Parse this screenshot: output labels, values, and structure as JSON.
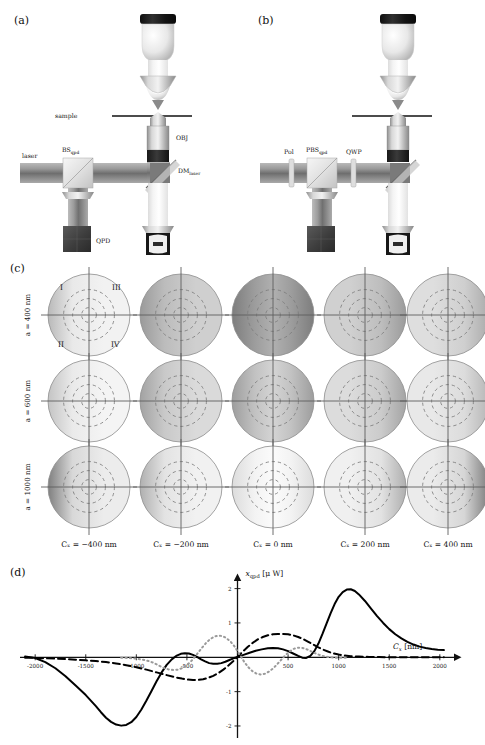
{
  "figure": {
    "panels": [
      {
        "tag": "(a)",
        "x": 14,
        "y": 14
      },
      {
        "tag": "(b)",
        "x": 258,
        "y": 14
      },
      {
        "tag": "(c)",
        "x": 10,
        "y": 262
      },
      {
        "tag": "(d)",
        "x": 10,
        "y": 566
      }
    ]
  },
  "panel_a": {
    "tag": "(a)",
    "labels": {
      "laser": "laser",
      "bs_main": "BS",
      "bs_sub": "qpd",
      "sample": "sample",
      "obj": "OBJ",
      "dm_main": "DM",
      "dm_sub": "laser",
      "qpd": "QPD"
    }
  },
  "panel_b": {
    "tag": "(b)",
    "labels": {
      "pol": "Pol",
      "pbs_main": "PBS",
      "pbs_sub": "qpd",
      "qwp": "QWP"
    }
  },
  "panel_c": {
    "tag": "(c)",
    "row_labels": [
      "a = 400 nm",
      "a = 600 nm",
      "a = 1000 nm"
    ],
    "col_labels": [
      "Cₓ = −400 nm",
      "Cₓ = −200 nm",
      "Cₓ = 0 nm",
      "Cₓ = 200 nm",
      "Cₓ = 400 nm"
    ],
    "quadrant_labels": [
      "I",
      "III",
      "II",
      "IV"
    ],
    "cx_values": [
      -400,
      -200,
      0,
      200,
      400
    ],
    "a_values": [
      400,
      600,
      1000
    ],
    "disk_shading": [
      [
        {
          "base": "#e9e9e9",
          "edge_dark": "#b9b9b9",
          "dir": 0.15,
          "center": "#f2f2f2"
        },
        {
          "base": "#bcbcbc",
          "edge_dark": "#9a9a9a",
          "dir": 0.45,
          "center": "#cfcfcf"
        },
        {
          "base": "#9d9d9d",
          "edge_dark": "#7d7d7d",
          "dir": 0.85,
          "center": "#b0b0b0"
        },
        {
          "base": "#bdbdbd",
          "edge_dark": "#9b9b9b",
          "dir": 0.45,
          "center": "#d0d0d0"
        },
        {
          "base": "#cfcfcf",
          "edge_dark": "#ababab",
          "dir": 0.3,
          "center": "#dedede"
        }
      ],
      [
        {
          "base": "#eaeaea",
          "edge_dark": "#c4c4c4",
          "dir": 0.2,
          "center": "#f4f4f4"
        },
        {
          "base": "#c9c9c9",
          "edge_dark": "#a2a2a2",
          "dir": 0.4,
          "center": "#dadada"
        },
        {
          "base": "#c2c2c2",
          "edge_dark": "#9d9d9d",
          "dir": 0.55,
          "center": "#d4d4d4"
        },
        {
          "base": "#cbcbcb",
          "edge_dark": "#a4a4a4",
          "dir": 0.4,
          "center": "#dcdcdc"
        },
        {
          "base": "#dcdcdc",
          "edge_dark": "#b6b6b6",
          "dir": 0.25,
          "center": "#e8e8e8"
        }
      ],
      [
        {
          "base": "#d8d8d8",
          "edge_dark": "#7f7f7f",
          "dir": 0.95,
          "center": "#ececec"
        },
        {
          "base": "#e3e3e3",
          "edge_dark": "#b0b0b0",
          "dir": 0.5,
          "center": "#f1f1f1"
        },
        {
          "base": "#f3f3f3",
          "edge_dark": "#dcdcdc",
          "dir": 0.1,
          "center": "#fbfbfb"
        },
        {
          "base": "#e2e2e2",
          "edge_dark": "#afafaf",
          "dir": 0.5,
          "center": "#f0f0f0"
        },
        {
          "base": "#d6d6d6",
          "edge_dark": "#7c7c7c",
          "dir": 0.95,
          "center": "#ebebeb"
        }
      ]
    ]
  },
  "panel_d": {
    "tag": "(d)"
  },
  "chart_data": {
    "type": "line",
    "title": "",
    "xlabel": "Cₓ [nm]",
    "ylabel": "x_qpd [μW]",
    "ylabel_main": "x",
    "ylabel_sub": "qpd",
    "ylabel_unit": "[μ W]",
    "xlabel_main": "C",
    "xlabel_sub": "x",
    "xlabel_unit": "[nm]",
    "xlim": [
      -2150,
      2150
    ],
    "ylim": [
      -2.35,
      2.25
    ],
    "xticks": [
      -2000,
      -1500,
      -1000,
      -500,
      500,
      1000,
      1500,
      2000
    ],
    "xticklabels": [
      "-2000",
      "-1500",
      "-1000",
      "-500",
      "500",
      "1000",
      "1500",
      "2000"
    ],
    "yticks": [
      2,
      1,
      -1,
      -2
    ],
    "yticklabels": [
      "2",
      "1",
      "-1",
      "-2"
    ],
    "grid": false,
    "legend": "none",
    "series": [
      {
        "name": "solid",
        "style": "solid",
        "color": "#000000",
        "width": 2.0,
        "points": [
          [
            -2100,
            0.02
          ],
          [
            -2000,
            -0.02
          ],
          [
            -1900,
            -0.14
          ],
          [
            -1800,
            -0.32
          ],
          [
            -1700,
            -0.55
          ],
          [
            -1600,
            -0.82
          ],
          [
            -1500,
            -1.1
          ],
          [
            -1400,
            -1.42
          ],
          [
            -1350,
            -1.6
          ],
          [
            -1300,
            -1.76
          ],
          [
            -1250,
            -1.88
          ],
          [
            -1200,
            -1.96
          ],
          [
            -1150,
            -1.99
          ],
          [
            -1100,
            -1.97
          ],
          [
            -1050,
            -1.89
          ],
          [
            -1000,
            -1.74
          ],
          [
            -950,
            -1.52
          ],
          [
            -900,
            -1.26
          ],
          [
            -850,
            -0.98
          ],
          [
            -800,
            -0.7
          ],
          [
            -750,
            -0.44
          ],
          [
            -700,
            -0.22
          ],
          [
            -650,
            -0.06
          ],
          [
            -600,
            0.05
          ],
          [
            -560,
            0.1
          ],
          [
            -520,
            0.12
          ],
          [
            -480,
            0.11
          ],
          [
            -440,
            0.07
          ],
          [
            -400,
            0.01
          ],
          [
            -360,
            -0.06
          ],
          [
            -320,
            -0.12
          ],
          [
            -280,
            -0.17
          ],
          [
            -240,
            -0.19
          ],
          [
            -200,
            -0.19
          ],
          [
            -160,
            -0.17
          ],
          [
            -120,
            -0.13
          ],
          [
            -80,
            -0.08
          ],
          [
            -40,
            -0.03
          ],
          [
            0,
            0.01
          ],
          [
            60,
            0.07
          ],
          [
            120,
            0.13
          ],
          [
            180,
            0.19
          ],
          [
            240,
            0.23
          ],
          [
            300,
            0.26
          ],
          [
            350,
            0.27
          ],
          [
            400,
            0.26
          ],
          [
            450,
            0.23
          ],
          [
            500,
            0.18
          ],
          [
            550,
            0.11
          ],
          [
            600,
            0.04
          ],
          [
            640,
            -0.01
          ],
          [
            680,
            -0.02
          ],
          [
            720,
            0.04
          ],
          [
            760,
            0.18
          ],
          [
            800,
            0.4
          ],
          [
            840,
            0.68
          ],
          [
            880,
            0.98
          ],
          [
            920,
            1.28
          ],
          [
            960,
            1.55
          ],
          [
            1000,
            1.76
          ],
          [
            1040,
            1.9
          ],
          [
            1080,
            1.97
          ],
          [
            1120,
            1.98
          ],
          [
            1160,
            1.93
          ],
          [
            1200,
            1.83
          ],
          [
            1260,
            1.64
          ],
          [
            1320,
            1.42
          ],
          [
            1380,
            1.2
          ],
          [
            1440,
            1.0
          ],
          [
            1500,
            0.82
          ],
          [
            1560,
            0.67
          ],
          [
            1620,
            0.55
          ],
          [
            1680,
            0.45
          ],
          [
            1740,
            0.37
          ],
          [
            1800,
            0.31
          ],
          [
            1860,
            0.27
          ],
          [
            1920,
            0.24
          ],
          [
            1980,
            0.22
          ],
          [
            2040,
            0.21
          ]
        ]
      },
      {
        "name": "dashed",
        "style": "dashed",
        "color": "#000000",
        "width": 2.0,
        "points": [
          [
            -2100,
            -0.01
          ],
          [
            -2000,
            -0.02
          ],
          [
            -1900,
            -0.03
          ],
          [
            -1800,
            -0.04
          ],
          [
            -1700,
            -0.05
          ],
          [
            -1600,
            -0.07
          ],
          [
            -1500,
            -0.09
          ],
          [
            -1400,
            -0.11
          ],
          [
            -1300,
            -0.14
          ],
          [
            -1200,
            -0.18
          ],
          [
            -1100,
            -0.23
          ],
          [
            -1000,
            -0.29
          ],
          [
            -900,
            -0.36
          ],
          [
            -800,
            -0.44
          ],
          [
            -700,
            -0.52
          ],
          [
            -620,
            -0.58
          ],
          [
            -550,
            -0.62
          ],
          [
            -490,
            -0.65
          ],
          [
            -440,
            -0.66
          ],
          [
            -390,
            -0.66
          ],
          [
            -340,
            -0.64
          ],
          [
            -290,
            -0.6
          ],
          [
            -240,
            -0.54
          ],
          [
            -190,
            -0.46
          ],
          [
            -140,
            -0.36
          ],
          [
            -90,
            -0.24
          ],
          [
            -40,
            -0.11
          ],
          [
            0,
            0.01
          ],
          [
            50,
            0.16
          ],
          [
            100,
            0.3
          ],
          [
            150,
            0.42
          ],
          [
            200,
            0.52
          ],
          [
            250,
            0.59
          ],
          [
            300,
            0.64
          ],
          [
            350,
            0.67
          ],
          [
            400,
            0.68
          ],
          [
            450,
            0.68
          ],
          [
            500,
            0.67
          ],
          [
            550,
            0.64
          ],
          [
            600,
            0.59
          ],
          [
            650,
            0.53
          ],
          [
            700,
            0.45
          ],
          [
            750,
            0.37
          ],
          [
            800,
            0.29
          ],
          [
            850,
            0.22
          ],
          [
            900,
            0.16
          ],
          [
            950,
            0.11
          ],
          [
            1000,
            0.08
          ],
          [
            1060,
            0.05
          ],
          [
            1120,
            0.03
          ],
          [
            1200,
            0.02
          ],
          [
            1300,
            0.01
          ],
          [
            1400,
            0.01
          ],
          [
            1500,
            0.0
          ],
          [
            1700,
            0.0
          ],
          [
            1900,
            0.0
          ],
          [
            2040,
            0.0
          ]
        ]
      },
      {
        "name": "dotted",
        "style": "dotted",
        "color": "#9a9a9a",
        "width": 2.0,
        "points": [
          [
            -1150,
            -0.01
          ],
          [
            -1080,
            -0.02
          ],
          [
            -1000,
            -0.04
          ],
          [
            -940,
            -0.07
          ],
          [
            -880,
            -0.11
          ],
          [
            -830,
            -0.16
          ],
          [
            -790,
            -0.22
          ],
          [
            -750,
            -0.28
          ],
          [
            -710,
            -0.33
          ],
          [
            -670,
            -0.36
          ],
          [
            -630,
            -0.37
          ],
          [
            -590,
            -0.36
          ],
          [
            -550,
            -0.32
          ],
          [
            -510,
            -0.25
          ],
          [
            -470,
            -0.15
          ],
          [
            -430,
            -0.02
          ],
          [
            -390,
            0.13
          ],
          [
            -350,
            0.28
          ],
          [
            -310,
            0.42
          ],
          [
            -270,
            0.53
          ],
          [
            -230,
            0.6
          ],
          [
            -190,
            0.63
          ],
          [
            -150,
            0.62
          ],
          [
            -110,
            0.56
          ],
          [
            -70,
            0.46
          ],
          [
            -30,
            0.32
          ],
          [
            0,
            0.18
          ],
          [
            30,
            0.04
          ],
          [
            70,
            -0.15
          ],
          [
            110,
            -0.3
          ],
          [
            150,
            -0.41
          ],
          [
            190,
            -0.48
          ],
          [
            230,
            -0.5
          ],
          [
            270,
            -0.48
          ],
          [
            310,
            -0.42
          ],
          [
            350,
            -0.33
          ],
          [
            390,
            -0.21
          ],
          [
            430,
            -0.08
          ],
          [
            470,
            0.05
          ],
          [
            510,
            0.16
          ],
          [
            550,
            0.24
          ],
          [
            590,
            0.28
          ],
          [
            630,
            0.28
          ],
          [
            670,
            0.25
          ],
          [
            710,
            0.2
          ],
          [
            750,
            0.14
          ],
          [
            790,
            0.09
          ],
          [
            840,
            0.04
          ],
          [
            890,
            0.01
          ],
          [
            950,
            -0.01
          ],
          [
            1020,
            -0.01
          ],
          [
            1100,
            -0.01
          ]
        ]
      }
    ]
  }
}
